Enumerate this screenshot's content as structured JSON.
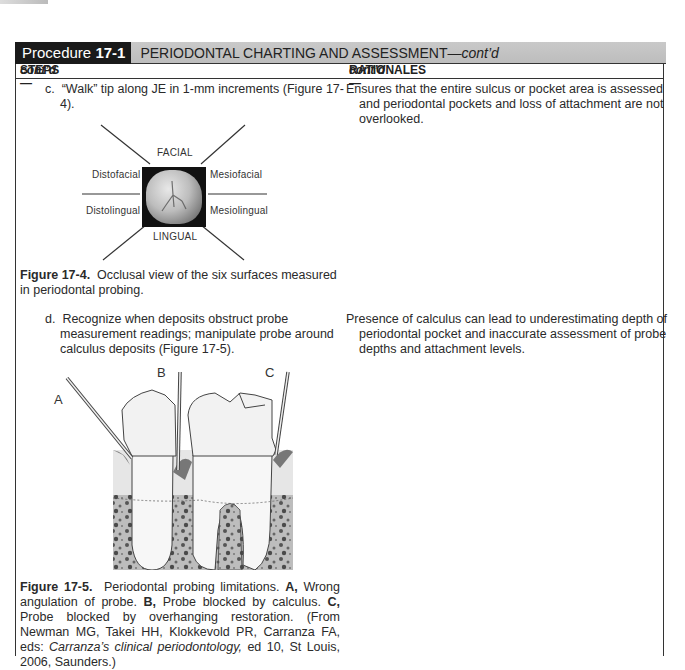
{
  "header": {
    "procedure_prefix": "Procedure ",
    "procedure_number": "17-1",
    "title_main": "PERIODONTAL CHARTING AND ASSESSMENT—",
    "title_cont": "cont’d"
  },
  "columns": {
    "steps_label": "STEPS—",
    "steps_cont": "cont’d",
    "rationales_label": "RATIONALES—",
    "rationales_cont": "cont’d"
  },
  "steps": [
    {
      "letter": "c.",
      "text": "“Walk” tip along JE in 1-mm increments (Figure 17-4).",
      "rationale": "Ensures that the entire sulcus or pocket area is assessed and periodontal pockets and loss of attachment are not overlooked."
    },
    {
      "letter": "d.",
      "text": "Recognize when deposits obstruct probe measurement readings; manipulate probe around calculus deposits (Figure 17-5).",
      "rationale": "Presence of calculus can lead to underestimating depth of periodontal pocket and inaccurate assessment of probe depths and attachment levels."
    }
  ],
  "figure_17_4": {
    "labels": {
      "facial": "FACIAL",
      "lingual": "LINGUAL",
      "distofacial": "Distofacial",
      "mesiofacial": "Mesiofacial",
      "distolingual": "Distolingual",
      "mesiolingual": "Mesiolingual"
    },
    "caption_label": "Figure 17-4.",
    "caption_text": "  Occlusal view of the six surfaces measured in periodontal probing."
  },
  "figure_17_5": {
    "labels": {
      "a": "A",
      "b": "B",
      "c": "C"
    },
    "caption_label": "Figure 17-5.",
    "caption_intro": "  Periodontal probing limitations. ",
    "a_label": "A,",
    "a_text": " Wrong angulation of probe. ",
    "b_label": "B,",
    "b_text": " Probe blocked by calculus. ",
    "c_label": "C,",
    "c_text": " Probe blocked by overhanging restoration. (From Newman MG, Takei HH, Klokkevold PR, Carranza FA, eds: ",
    "book_title": "Carranza’s clinical periodontology,",
    "source_tail": " ed 10, St Louis, 2006, Saunders.)"
  }
}
